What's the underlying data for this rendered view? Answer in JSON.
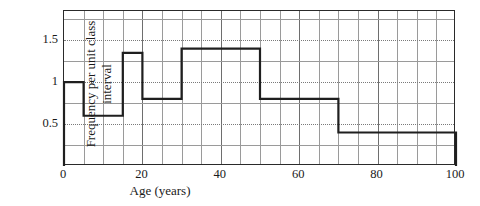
{
  "chart_data": {
    "type": "bar",
    "title": "",
    "subtitle": "",
    "xlabel": "Age (years)",
    "ylabel": "Frequency per unit class interval",
    "xlim": [
      0,
      100
    ],
    "ylim": [
      0,
      1.85
    ],
    "grid": true,
    "legend": false,
    "legend_position": "none",
    "x_tick_labels": [
      "0",
      "20",
      "40",
      "60",
      "80",
      "100"
    ],
    "x_tick_values": [
      0,
      20,
      40,
      60,
      80,
      100
    ],
    "x_minor_step": 5,
    "y_tick_labels": [
      "0.5",
      "1",
      "1.5"
    ],
    "y_tick_values": [
      0.5,
      1,
      1.5
    ],
    "y_minor_step": 0.25,
    "bin_edges": [
      0,
      5,
      15,
      20,
      30,
      50,
      70,
      100
    ],
    "bins": [
      {
        "label": "0–5",
        "start": 0,
        "end": 5,
        "density": 1.0
      },
      {
        "label": "5–15",
        "start": 5,
        "end": 15,
        "density": 0.6
      },
      {
        "label": "15–20",
        "start": 15,
        "end": 20,
        "density": 1.35
      },
      {
        "label": "20–30",
        "start": 20,
        "end": 30,
        "density": 0.8
      },
      {
        "label": "30–50",
        "start": 30,
        "end": 50,
        "density": 1.4
      },
      {
        "label": "50–70",
        "start": 50,
        "end": 70,
        "density": 0.8
      },
      {
        "label": "70–100",
        "start": 70,
        "end": 100,
        "density": 0.4
      }
    ],
    "values": [
      1.0,
      0.6,
      1.35,
      0.8,
      1.4,
      0.8,
      0.4
    ],
    "categories": [
      "0–5",
      "5–15",
      "15–20",
      "20–30",
      "30–50",
      "50–70",
      "70–100"
    ],
    "colors": {
      "outline": "#1f1f1f",
      "grid_minor": "#9a9a9a",
      "grid_major": "#7a7a7a",
      "frame": "#2a2a2a",
      "background": "#ffffff",
      "text": "#1a1a1a"
    }
  }
}
